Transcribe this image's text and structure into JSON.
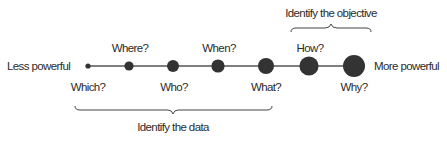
{
  "diagram": {
    "axis": {
      "left_label": "Less powerful",
      "right_label": "More powerful",
      "line_color": "#555555",
      "dot_color": "#333333"
    },
    "nodes": [
      {
        "label": "Which?",
        "position": "below",
        "size": "smallest"
      },
      {
        "label": "Where?",
        "position": "above",
        "size": "small"
      },
      {
        "label": "Who?",
        "position": "below",
        "size": "medium-small"
      },
      {
        "label": "When?",
        "position": "above",
        "size": "medium"
      },
      {
        "label": "What?",
        "position": "below",
        "size": "medium-large"
      },
      {
        "label": "How?",
        "position": "above",
        "size": "large"
      },
      {
        "label": "Why?",
        "position": "below",
        "size": "largest"
      }
    ],
    "brackets": [
      {
        "label": "Identify the data",
        "spans": [
          "Which?",
          "What?"
        ],
        "position": "below"
      },
      {
        "label": "Identify the objective",
        "spans": [
          "How?",
          "Why?"
        ],
        "position": "above"
      }
    ]
  }
}
